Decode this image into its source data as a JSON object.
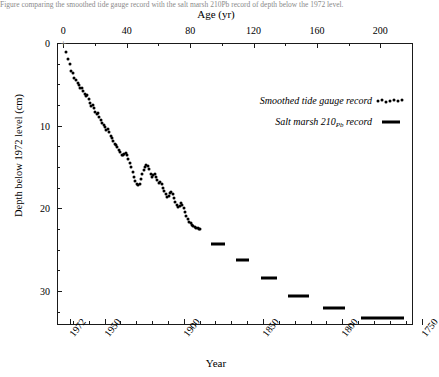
{
  "figure": {
    "top_axis_title": "Age (yr)",
    "bottom_axis_title": "Year",
    "y_axis_title": "Depth below 1972 level (cm)",
    "caption": "Figure comparing the smoothed tide gauge record with the salt marsh 210Pb record of depth below the 1972 level."
  },
  "legend": {
    "position": "upper-right-inside",
    "entries": [
      {
        "label": "Smoothed tide gauge record",
        "marker": "dots"
      },
      {
        "label_prefix": "Salt marsh 210",
        "label_sub": "Pb",
        "label_suffix": " record",
        "marker": "bar"
      }
    ]
  },
  "chart_data": {
    "type": "scatter",
    "title": "",
    "xlabel": "Year",
    "xlabel_top": "Age (yr)",
    "ylabel": "Depth below 1972 level (cm)",
    "grid": false,
    "y_axis_inverted": true,
    "ylim": [
      0,
      34
    ],
    "y_ticks": [
      0,
      10,
      20,
      30
    ],
    "y_minor_interval": 2.5,
    "x_top": {
      "label": "Age (yr)",
      "lim": [
        -4,
        220
      ],
      "ticks": [
        0,
        40,
        80,
        120,
        160,
        200
      ],
      "minor_ticks": [
        20,
        60,
        100,
        140,
        180
      ]
    },
    "x_bottom": {
      "label": "Year",
      "lim": [
        1976,
        1752
      ],
      "ticks": [
        1972,
        1950,
        1900,
        1850,
        1800,
        1750
      ],
      "tick_labels": [
        "1972",
        "1950",
        "1900",
        "1850",
        "1800",
        "1750"
      ],
      "minor_interval": 10
    },
    "origin_marker": {
      "symbol": "+",
      "age": 0,
      "depth": 0
    },
    "series": [
      {
        "name": "Smoothed tide gauge record",
        "type": "scatter",
        "marker": "dot",
        "color": "#000000",
        "points": [
          [
            1.5,
            1.1
          ],
          [
            3.0,
            1.9
          ],
          [
            4.2,
            2.6
          ],
          [
            5.0,
            3.4
          ],
          [
            6.2,
            3.6
          ],
          [
            7.0,
            4.2
          ],
          [
            8.1,
            4.5
          ],
          [
            9.0,
            4.9
          ],
          [
            9.8,
            5.1
          ],
          [
            10.8,
            5.5
          ],
          [
            11.6,
            5.4
          ],
          [
            12.5,
            5.8
          ],
          [
            13.4,
            6.2
          ],
          [
            14.2,
            6.4
          ],
          [
            15.0,
            6.3
          ],
          [
            15.9,
            6.8
          ],
          [
            16.8,
            7.2
          ],
          [
            17.6,
            7.6
          ],
          [
            18.4,
            7.5
          ],
          [
            19.2,
            7.9
          ],
          [
            20.2,
            8.3
          ],
          [
            21.0,
            8.6
          ],
          [
            21.9,
            8.5
          ],
          [
            22.8,
            8.9
          ],
          [
            23.7,
            9.3
          ],
          [
            24.5,
            9.7
          ],
          [
            25.4,
            9.9
          ],
          [
            26.3,
            10.2
          ],
          [
            27.1,
            10.5
          ],
          [
            28.0,
            10.4
          ],
          [
            28.9,
            10.8
          ],
          [
            29.8,
            11.2
          ],
          [
            30.6,
            11.5
          ],
          [
            31.5,
            11.9
          ],
          [
            32.4,
            12.2
          ],
          [
            33.2,
            12.4
          ],
          [
            34.1,
            12.6
          ],
          [
            35.0,
            12.9
          ],
          [
            35.9,
            13.2
          ],
          [
            36.7,
            13.5
          ],
          [
            37.6,
            13.6
          ],
          [
            38.5,
            13.4
          ],
          [
            39.3,
            13.3
          ],
          [
            40.2,
            13.6
          ],
          [
            41.1,
            14.0
          ],
          [
            42.0,
            14.5
          ],
          [
            42.8,
            15.0
          ],
          [
            43.7,
            15.6
          ],
          [
            44.6,
            16.2
          ],
          [
            45.4,
            16.7
          ],
          [
            46.3,
            17.0
          ],
          [
            47.2,
            17.2
          ],
          [
            48.1,
            17.0
          ],
          [
            48.9,
            16.5
          ],
          [
            49.8,
            15.9
          ],
          [
            50.7,
            15.4
          ],
          [
            51.5,
            15.0
          ],
          [
            52.4,
            14.8
          ],
          [
            53.3,
            14.9
          ],
          [
            54.2,
            15.3
          ],
          [
            55.0,
            15.8
          ],
          [
            55.9,
            16.2
          ],
          [
            56.8,
            16.0
          ],
          [
            57.6,
            15.9
          ],
          [
            58.5,
            16.2
          ],
          [
            59.4,
            16.6
          ],
          [
            60.3,
            16.9
          ],
          [
            61.1,
            16.8
          ],
          [
            62.0,
            17.0
          ],
          [
            62.9,
            17.5
          ],
          [
            63.7,
            17.9
          ],
          [
            64.6,
            18.3
          ],
          [
            65.5,
            18.6
          ],
          [
            66.4,
            18.5
          ],
          [
            67.2,
            18.2
          ],
          [
            68.1,
            18.0
          ],
          [
            69.0,
            18.3
          ],
          [
            69.8,
            18.8
          ],
          [
            70.7,
            19.2
          ],
          [
            71.6,
            19.6
          ],
          [
            72.5,
            19.9
          ],
          [
            73.3,
            19.7
          ],
          [
            74.2,
            19.4
          ],
          [
            75.1,
            19.6
          ],
          [
            75.9,
            20.0
          ],
          [
            76.8,
            20.4
          ],
          [
            77.7,
            20.9
          ],
          [
            78.6,
            21.3
          ],
          [
            79.4,
            21.6
          ],
          [
            80.3,
            21.8
          ],
          [
            81.2,
            22.0
          ],
          [
            82.0,
            22.2
          ],
          [
            82.9,
            22.3
          ],
          [
            83.8,
            22.4
          ],
          [
            84.7,
            22.4
          ],
          [
            85.5,
            22.5
          ],
          [
            86.4,
            22.5
          ]
        ]
      },
      {
        "name": "Salt marsh 210Pb record",
        "type": "bar-segments",
        "marker": "bar",
        "color": "#000000",
        "segments": [
          {
            "age_start": 93,
            "age_end": 102,
            "depth": 24.3
          },
          {
            "age_start": 109,
            "age_end": 117,
            "depth": 26.3
          },
          {
            "age_start": 125,
            "age_end": 135,
            "depth": 28.4
          },
          {
            "age_start": 142,
            "age_end": 155,
            "depth": 30.6
          },
          {
            "age_start": 164,
            "age_end": 178,
            "depth": 32.1
          },
          {
            "age_start": 188,
            "age_end": 215,
            "depth": 33.3
          }
        ]
      }
    ]
  }
}
